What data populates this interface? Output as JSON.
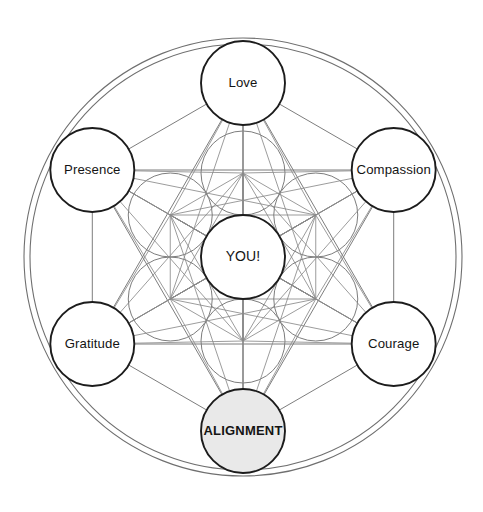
{
  "diagram": {
    "type": "metatrons-cube",
    "canvas": {
      "width": 483,
      "height": 512
    },
    "geometry": {
      "center": {
        "x": 243,
        "y": 257
      },
      "outer_ring_radius": 219,
      "inner_ring_radius": 213,
      "node_radius": 42,
      "lattice_radius": 42,
      "lattice_ring_distance": 84,
      "node_ring_distance": 174
    },
    "colors": {
      "background": "#ffffff",
      "node_stroke": "#1c1c1c",
      "node_fill": "#ffffff",
      "highlight_fill": "#e9e9e9",
      "lattice_stroke": "#8a8a8a",
      "ring_stroke": "#6f6f6f",
      "text": "#141414"
    },
    "center_node": {
      "id": "you",
      "label": "YOU!",
      "fill": "#ffffff",
      "bold": false,
      "angle_deg": null
    },
    "nodes": [
      {
        "id": "love",
        "label": "Love",
        "angle_deg": -90,
        "fill": "#ffffff",
        "bold": false
      },
      {
        "id": "compassion",
        "label": "Compassion",
        "angle_deg": -30,
        "fill": "#ffffff",
        "bold": false
      },
      {
        "id": "courage",
        "label": "Courage",
        "angle_deg": 30,
        "fill": "#ffffff",
        "bold": false
      },
      {
        "id": "alignment",
        "label": "ALIGNMENT",
        "angle_deg": 90,
        "fill": "#e9e9e9",
        "bold": true
      },
      {
        "id": "gratitude",
        "label": "Gratitude",
        "angle_deg": 150,
        "fill": "#ffffff",
        "bold": false
      },
      {
        "id": "presence",
        "label": "Presence",
        "angle_deg": 210,
        "fill": "#ffffff",
        "bold": false
      }
    ],
    "lattice_nodes": [
      {
        "id": "lattice-n",
        "angle_deg": -90
      },
      {
        "id": "lattice-ne",
        "angle_deg": -30
      },
      {
        "id": "lattice-se",
        "angle_deg": 30
      },
      {
        "id": "lattice-s",
        "angle_deg": 90
      },
      {
        "id": "lattice-sw",
        "angle_deg": 150
      },
      {
        "id": "lattice-nw",
        "angle_deg": 210
      }
    ]
  }
}
